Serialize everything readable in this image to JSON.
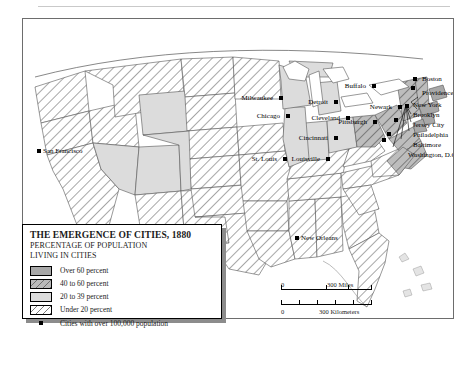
{
  "map": {
    "frame_label": "map-frame",
    "title": "THE EMERGENCE OF CITIES, 1880"
  },
  "legend": {
    "title": "THE EMERGENCE OF CITIES, 1880",
    "subtitle_line1": "PERCENTAGE OF POPULATION",
    "subtitle_line2": "LIVING IN CITIES",
    "items": [
      {
        "label": "Over 60 percent",
        "pattern": "solid-gray",
        "color": "#a8a8a8"
      },
      {
        "label": "40 to 60 percent",
        "pattern": "hatched-gray",
        "color": "#b9b9b9"
      },
      {
        "label": "20 to 39 percent",
        "pattern": "solid-light-gray",
        "color": "#dcdcdc"
      },
      {
        "label": "Under 20 percent",
        "pattern": "hatched-white",
        "color": "#ffffff"
      }
    ],
    "point_label": "Cities with over 100,000 population"
  },
  "scale": {
    "miles": {
      "zero": "0",
      "value": "300 Miles"
    },
    "kilometers": {
      "zero": "0",
      "value": "300 Kilometers"
    }
  },
  "cities": [
    {
      "name": "San Francisco",
      "x": 36,
      "y": 148,
      "side": "right"
    },
    {
      "name": "Milwaukee",
      "x": 278,
      "y": 95,
      "side": "left"
    },
    {
      "name": "Chicago",
      "x": 285,
      "y": 113,
      "side": "left"
    },
    {
      "name": "St. Louis",
      "x": 282,
      "y": 156,
      "side": "left"
    },
    {
      "name": "Detroit",
      "x": 333,
      "y": 99,
      "side": "left"
    },
    {
      "name": "Cleveland",
      "x": 345,
      "y": 115,
      "side": "left"
    },
    {
      "name": "Cincinnati",
      "x": 333,
      "y": 135,
      "side": "left"
    },
    {
      "name": "Louisville",
      "x": 325,
      "y": 156,
      "side": "left"
    },
    {
      "name": "Buffalo",
      "x": 371,
      "y": 83,
      "side": "left"
    },
    {
      "name": "Pittsburgh",
      "x": 372,
      "y": 119,
      "side": "left"
    },
    {
      "name": "Newark",
      "x": 397,
      "y": 104,
      "side": "left"
    },
    {
      "name": "New Orleans",
      "x": 294,
      "y": 235,
      "side": "right"
    }
  ],
  "northeast_labels": [
    {
      "name": "Boston",
      "x": 421,
      "y": 74
    },
    {
      "name": "Providence",
      "x": 421,
      "y": 88
    },
    {
      "name": "New York",
      "x": 412,
      "y": 100
    },
    {
      "name": "Brooklyn",
      "x": 412,
      "y": 110
    },
    {
      "name": "Jersey City",
      "x": 412,
      "y": 120
    },
    {
      "name": "Philadelphia",
      "x": 412,
      "y": 130
    },
    {
      "name": "Baltimore",
      "x": 412,
      "y": 140
    },
    {
      "name": "Washington, D.C.",
      "x": 407,
      "y": 150
    }
  ],
  "northeast_dots": [
    {
      "name": "Boston",
      "x": 412,
      "y": 76
    },
    {
      "name": "Providence",
      "x": 410,
      "y": 85
    },
    {
      "name": "New York",
      "x": 404,
      "y": 103
    },
    {
      "name": "Philadelphia",
      "x": 393,
      "y": 117
    },
    {
      "name": "Baltimore",
      "x": 386,
      "y": 131
    },
    {
      "name": "Washington",
      "x": 381,
      "y": 137
    }
  ],
  "chart_data": {
    "type": "map",
    "title": "THE EMERGENCE OF CITIES, 1880",
    "variable": "Percentage of population living in cities",
    "classes": [
      {
        "label": "Over 60 percent",
        "range": [
          60,
          100
        ]
      },
      {
        "label": "40 to 60 percent",
        "range": [
          40,
          60
        ]
      },
      {
        "label": "20 to 39 percent",
        "range": [
          20,
          39
        ]
      },
      {
        "label": "Under 20 percent",
        "range": [
          0,
          20
        ]
      }
    ],
    "point_series": {
      "label": "Cities with over 100,000 population",
      "names": [
        "San Francisco",
        "Milwaukee",
        "Chicago",
        "St. Louis",
        "Detroit",
        "Cleveland",
        "Cincinnati",
        "Louisville",
        "Buffalo",
        "Pittsburgh",
        "Newark",
        "New Orleans",
        "Boston",
        "Providence",
        "New York",
        "Brooklyn",
        "Jersey City",
        "Philadelphia",
        "Baltimore",
        "Washington, D.C."
      ]
    },
    "scale_bar": [
      "300 Miles",
      "300 Kilometers"
    ]
  }
}
